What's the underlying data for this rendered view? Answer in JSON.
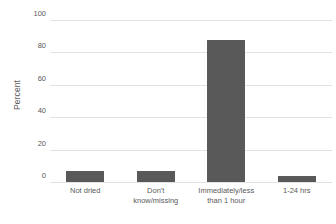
{
  "chart_data": {
    "type": "bar",
    "title": "",
    "subtitle": "",
    "xlabel": "",
    "ylabel": "Percent",
    "ylim": [
      0,
      100
    ],
    "yticks": [
      0,
      20,
      40,
      60,
      80,
      100
    ],
    "ytick_labels": [
      "0",
      "20",
      "40",
      "60",
      "80",
      "100"
    ],
    "grid": "horizontal",
    "legend": "none",
    "bar_color": "#595959",
    "gridline_color": "#e2e2e2",
    "background_color": "#ffffff",
    "categories": [
      "Not dried",
      "Don't know/missing",
      "Immediately/less than 1 hour",
      "1-24 hrs"
    ],
    "category_lines": [
      [
        "Not dried",
        ""
      ],
      [
        "Don't",
        "know/missing"
      ],
      [
        "Immediately/less",
        "than 1 hour"
      ],
      [
        "1-24 hrs",
        ""
      ]
    ],
    "values": [
      6.5,
      6.5,
      87.5,
      3.5
    ],
    "series": [
      {
        "name": "Percent",
        "values": [
          6.5,
          6.5,
          87.5,
          3.5
        ]
      }
    ]
  },
  "axis": {
    "y_title": "Percent"
  }
}
